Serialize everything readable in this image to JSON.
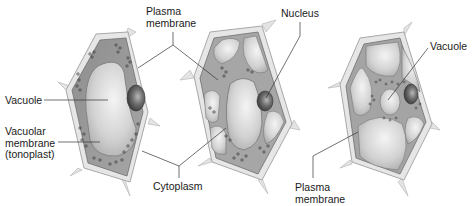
{
  "diagram": {
    "colors": {
      "cell_wall": "#e6e6e6",
      "cell_wall_edge": "#a8a8a8",
      "cytoplasm": "#9a9a9a",
      "vacuole": "#d6d6d6",
      "nucleus": "#5a5a5a",
      "leader_line": "#333333",
      "text": "#1a1a1a"
    },
    "cells": [
      {
        "name": "cell-1",
        "description": "Cell with single large central vacuole"
      },
      {
        "name": "cell-2",
        "description": "Cell with vacuole and cytoplasmic strands"
      },
      {
        "name": "cell-3",
        "description": "Cell with multiple vacuoles"
      }
    ],
    "labels": {
      "plasma_membrane_top": "Plasma\nmembrane",
      "nucleus": "Nucleus",
      "vacuole_left": "Vacuole",
      "vacuolar_membrane": "Vacuolar\nmembrane\n(tonoplast)",
      "cytoplasm": "Cytoplasm",
      "vacuole_right": "Vacuole",
      "plasma_membrane_bottom": "Plasma\nmembrane"
    }
  }
}
